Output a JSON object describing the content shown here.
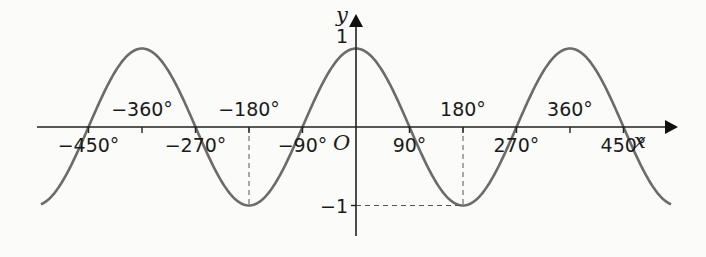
{
  "chart_data": {
    "type": "line",
    "title": "",
    "function": "y = cos x",
    "xlabel": "x",
    "ylabel": "y",
    "origin_label": "O",
    "xlim": [
      -540,
      540
    ],
    "ylim": [
      -1,
      1
    ],
    "grid": false,
    "x_ticks": [
      -450,
      -360,
      -270,
      -180,
      -90,
      90,
      180,
      270,
      360,
      450
    ],
    "x_tick_labels": [
      {
        "value": -450,
        "text": "−450°",
        "pos": "below"
      },
      {
        "value": -360,
        "text": "−360°",
        "pos": "above"
      },
      {
        "value": -270,
        "text": "−270°",
        "pos": "below"
      },
      {
        "value": -180,
        "text": "−180°",
        "pos": "above"
      },
      {
        "value": -90,
        "text": "−90°",
        "pos": "below"
      },
      {
        "value": 90,
        "text": "90°",
        "pos": "below"
      },
      {
        "value": 180,
        "text": "180°",
        "pos": "above"
      },
      {
        "value": 270,
        "text": "270°",
        "pos": "below"
      },
      {
        "value": 360,
        "text": "360°",
        "pos": "above"
      },
      {
        "value": 450,
        "text": "450°",
        "pos": "below"
      }
    ],
    "y_tick_labels": [
      {
        "value": 1,
        "text": "1"
      },
      {
        "value": -1,
        "text": "−1"
      }
    ],
    "series": [
      {
        "name": "cos x",
        "x": [
          -540,
          -450,
          -360,
          -270,
          -180,
          -90,
          0,
          90,
          180,
          270,
          360,
          450,
          540
        ],
        "values": [
          -1,
          0,
          1,
          0,
          -1,
          0,
          1,
          0,
          -1,
          0,
          1,
          0,
          -1
        ]
      }
    ],
    "annotations": [
      {
        "type": "dashed-vertical",
        "x": -180,
        "from": 0,
        "to": -1
      },
      {
        "type": "dashed-vertical",
        "x": 180,
        "from": 0,
        "to": -1
      },
      {
        "type": "dashed-horizontal",
        "y": -1,
        "from": 0,
        "to": 180
      }
    ]
  }
}
